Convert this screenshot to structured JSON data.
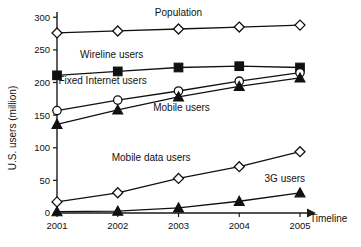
{
  "chart_data": {
    "type": "line",
    "title": "",
    "xlabel": "Timeline",
    "ylabel": "U.S. users (million)",
    "categories": [
      "2001",
      "2002",
      "2003",
      "2004",
      "2005"
    ],
    "xtick_labels": [
      "2001",
      "2002",
      "2003",
      "2004",
      "2005"
    ],
    "ytick_labels": [
      "0",
      "50",
      "100",
      "150",
      "200",
      "250",
      "300"
    ],
    "yticks": [
      0,
      50,
      100,
      150,
      200,
      250,
      300
    ],
    "ylim": [
      0,
      305
    ],
    "grid": false,
    "legend_position": "inline-annotations",
    "series": [
      {
        "name": "Population",
        "label": "Population",
        "marker": "open-diamond",
        "values": [
          276,
          279,
          282,
          285,
          288
        ],
        "label_x": 2003,
        "label_y": 302
      },
      {
        "name": "Wireline users",
        "label": "Wireline users",
        "marker": "filled-square",
        "values": [
          211,
          217,
          223,
          225,
          223
        ],
        "label_x": 2001.9,
        "label_y": 238
      },
      {
        "name": "Fixed Internet users",
        "label": "Fixed Internet users",
        "marker": "open-circle",
        "values": [
          157,
          173,
          187,
          202,
          215
        ],
        "label_x": 2001.75,
        "label_y": 197
      },
      {
        "name": "Mobile users",
        "label": "Mobile users",
        "marker": "filled-triangle",
        "values": [
          136,
          158,
          178,
          194,
          207
        ],
        "label_x": 2003.05,
        "label_y": 157
      },
      {
        "name": "Mobile data users",
        "label": "Mobile data users",
        "marker": "open-diamond",
        "values": [
          17,
          31,
          53,
          71,
          94
        ],
        "label_x": 2002.55,
        "label_y": 80
      },
      {
        "name": "3G users",
        "label": "3G users",
        "marker": "filled-triangle",
        "values": [
          2,
          3,
          8,
          18,
          31
        ],
        "label_x": 2004.75,
        "label_y": 48
      }
    ],
    "colors": {
      "axis": "#1a1a1a",
      "line": "#111111",
      "marker_fill_open": "#ffffff",
      "marker_fill_solid": "#111111",
      "background": "#ffffff"
    }
  }
}
